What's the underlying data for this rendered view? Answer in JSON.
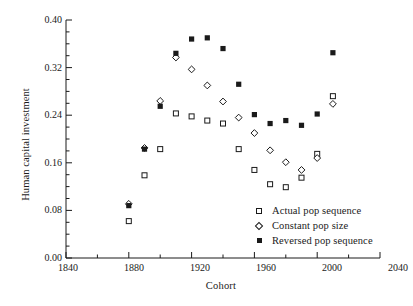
{
  "chart_data": {
    "type": "scatter",
    "title": "",
    "xlabel": "Cohort",
    "ylabel": "Human capital investment",
    "xlim": [
      1840,
      2040
    ],
    "ylim": [
      0.0,
      0.4
    ],
    "xticks": [
      1840,
      1880,
      1920,
      1960,
      2000,
      2040
    ],
    "xtick_labels": [
      "1840",
      "1880",
      "1920",
      "1960",
      "2000",
      "2040"
    ],
    "xminor_interval": 20,
    "yticks": [
      0.0,
      0.08,
      0.16,
      0.24,
      0.32,
      0.4
    ],
    "ytick_labels": [
      "0.00",
      "0.08",
      "0.16",
      "0.24",
      "0.32",
      "0.40"
    ],
    "yminor_interval": 0.02,
    "grid": false,
    "legend_position": "lower right",
    "x": [
      1880,
      1890,
      1900,
      1910,
      1920,
      1930,
      1940,
      1950,
      1960,
      1970,
      1980,
      1990,
      2000,
      2010
    ],
    "series": [
      {
        "name": "Actual pop sequence",
        "marker": "square-open",
        "values": [
          0.062,
          0.139,
          0.183,
          0.243,
          0.238,
          0.231,
          0.226,
          0.183,
          0.148,
          0.124,
          0.119,
          0.135,
          0.175,
          0.272
        ]
      },
      {
        "name": "Constant pop size",
        "marker": "diamond-open",
        "values": [
          0.091,
          0.185,
          0.264,
          0.337,
          0.317,
          0.29,
          0.263,
          0.236,
          0.21,
          0.181,
          0.161,
          0.148,
          0.168,
          0.259
        ]
      },
      {
        "name": "Reversed pop sequence",
        "marker": "square-filled",
        "values": [
          0.088,
          0.183,
          0.255,
          0.344,
          0.368,
          0.37,
          0.352,
          0.292,
          0.241,
          0.226,
          0.231,
          0.223,
          0.242,
          0.345
        ]
      }
    ]
  },
  "axis": {
    "x_title": "Cohort",
    "y_title": "Human capital investment"
  },
  "legend": {
    "items": [
      {
        "label": "Actual pop sequence",
        "marker": "square-open-icon"
      },
      {
        "label": "Constant pop size",
        "marker": "diamond-open-icon"
      },
      {
        "label": "Reversed pop sequence",
        "marker": "square-filled-icon"
      }
    ]
  }
}
